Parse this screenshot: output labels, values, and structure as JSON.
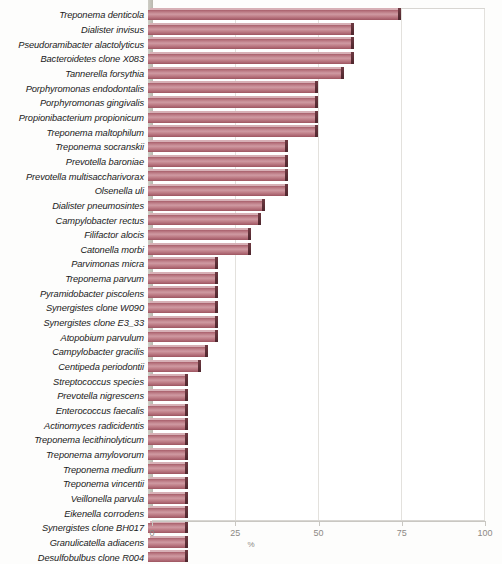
{
  "chart_data": {
    "type": "bar",
    "orientation": "horizontal",
    "title": "",
    "xlabel": "%",
    "ylabel": "",
    "xlim": [
      0,
      100
    ],
    "xticks": [
      0,
      25,
      50,
      75,
      100
    ],
    "xtick_labels": [
      "0",
      "25",
      "50",
      "75",
      "100"
    ],
    "grid": true,
    "legend": false,
    "bar_color": "#b5707a",
    "bar_edge_color": "#5a2d34",
    "categories": [
      "Treponema denticola",
      "Dialister invisus",
      "Pseudoramibacter alactolyticus",
      "Bacteroidetes clone X083",
      "Tannerella forsythia",
      "Porphyromonas endodontalis",
      "Porphyromonas gingivalis",
      "Propionibacterium propionicum",
      "Treponema maltophilum",
      "Treponema socranskii",
      "Prevotella baroniae",
      "Prevotella multisaccharivorax",
      "Olsenella uli",
      "Dialister pneumosintes",
      "Campylobacter rectus",
      "Filifactor alocis",
      "Catonella morbi",
      "Parvimonas micra",
      "Treponema parvum",
      "Pyramidobacter piscolens",
      "Synergistes clone W090",
      "Synergistes clone E3_33",
      "Atopobium parvulum",
      "Campylobacter gracilis",
      "Centipeda periodontii",
      "Streptococcus species",
      "Prevotella nigrescens",
      "Enterococcus faecalis",
      "Actinomyces radicidentis",
      "Treponema lecithinolyticum",
      "Treponema amylovorum",
      "Treponema medium",
      "Treponema vincentii",
      "Veillonella parvula",
      "Eikenella corrodens",
      "Synergistes clone BH017",
      "Granulicatella adiacens",
      "Desulfobulbus clone R004"
    ],
    "values": [
      76,
      62,
      62,
      62,
      59,
      51,
      51,
      51,
      51,
      42,
      42,
      42,
      42,
      35,
      34,
      31,
      31,
      21,
      21,
      21,
      21,
      21,
      21,
      18,
      16,
      12,
      12,
      12,
      12,
      12,
      12,
      12,
      12,
      12,
      12,
      12,
      12,
      12
    ]
  }
}
